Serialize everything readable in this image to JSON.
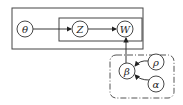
{
  "diagram": {
    "type": "plate-notation graphical model",
    "nodes": [
      {
        "id": "theta",
        "label": "θ",
        "cx": 25,
        "cy": 29
      },
      {
        "id": "Z",
        "label": "Z",
        "cx": 80,
        "cy": 29
      },
      {
        "id": "W",
        "label": "W",
        "cx": 125,
        "cy": 29
      },
      {
        "id": "beta",
        "label": "β",
        "cx": 128,
        "cy": 71
      },
      {
        "id": "rho",
        "label": "ρ",
        "cx": 156,
        "cy": 62
      },
      {
        "id": "alpha",
        "label": "α",
        "cx": 156,
        "cy": 84
      }
    ],
    "edges": [
      {
        "from": "theta",
        "to": "Z"
      },
      {
        "from": "Z",
        "to": "W"
      },
      {
        "from": "beta",
        "to": "W"
      },
      {
        "from": "rho",
        "to": "beta"
      },
      {
        "from": "alpha",
        "to": "beta"
      }
    ],
    "plates": [
      {
        "id": "outer-plate",
        "style": "solid",
        "contains": [
          "theta",
          "Z",
          "W"
        ]
      },
      {
        "id": "inner-plate",
        "style": "solid",
        "contains": [
          "Z",
          "W"
        ]
      },
      {
        "id": "prior-plate",
        "style": "dash-dot",
        "contains": [
          "beta",
          "rho",
          "alpha"
        ]
      }
    ],
    "colors": {
      "stroke": "#333333",
      "background": "#ffffff"
    }
  }
}
